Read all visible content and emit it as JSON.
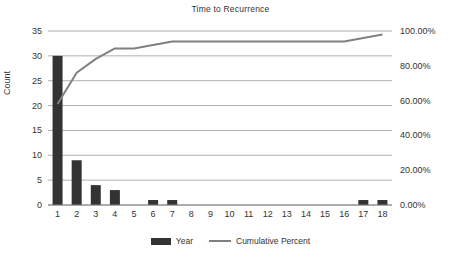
{
  "chart_data": {
    "type": "bar",
    "title": "Time to Recurrence",
    "xlabel": "",
    "ylabel": "Count",
    "y2label": "",
    "grid": true,
    "legend_position": "bottom",
    "categories": [
      "1",
      "2",
      "3",
      "4",
      "5",
      "6",
      "7",
      "8",
      "9",
      "10",
      "11",
      "12",
      "13",
      "14",
      "15",
      "16",
      "17",
      "18"
    ],
    "ylim": [
      0,
      35
    ],
    "y2lim": [
      0,
      100
    ],
    "ytick_labels": [
      "35",
      "30",
      "25",
      "20",
      "15",
      "10",
      "5",
      "0"
    ],
    "ytick_values": [
      35,
      30,
      25,
      20,
      15,
      10,
      5,
      0
    ],
    "y2tick_labels": [
      "100.00%",
      "80.00%",
      "60.00%",
      "40.00%",
      "20.00%",
      "0.00%"
    ],
    "y2tick_values": [
      100,
      80,
      60,
      40,
      20,
      0
    ],
    "series": [
      {
        "name": "Year",
        "type": "bar",
        "axis": "left",
        "color": "#333333",
        "values": [
          30,
          9,
          4,
          3,
          0,
          1,
          1,
          0,
          0,
          0,
          0,
          0,
          0,
          0,
          0,
          0,
          1,
          1
        ]
      },
      {
        "name": "Cumulative Percent",
        "type": "line",
        "axis": "right",
        "color": "#808080",
        "values": [
          58.0,
          76.0,
          84.0,
          90.0,
          90.0,
          92.0,
          94.0,
          94.0,
          94.0,
          94.0,
          94.0,
          94.0,
          94.0,
          94.0,
          94.0,
          94.0,
          96.0,
          98.0
        ]
      }
    ]
  },
  "legend": {
    "items": [
      {
        "label": "Year",
        "marker": "bar-swatch",
        "color": "#333333"
      },
      {
        "label": "Cumulative Percent",
        "marker": "line-swatch",
        "color": "#808080"
      }
    ]
  }
}
